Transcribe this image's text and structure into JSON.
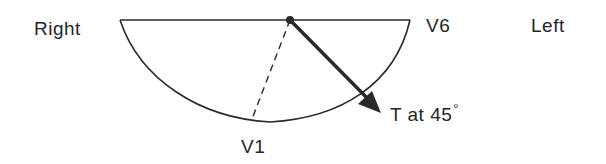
{
  "diagram": {
    "labels": {
      "right": "Right",
      "left": "Left",
      "v6": "V6",
      "v1": "V1",
      "t_vector": "T at 45",
      "degree_symbol": "°"
    },
    "elements": {
      "baseline": "horizontal line from Right side to V6",
      "semicircle": "lower half ellipse below baseline",
      "origin_dot": "filled dot at center of baseline",
      "v1_axis": "dashed line from origin toward V1",
      "t_arrow": "bold arrow from origin at 45 degrees"
    },
    "colors": {
      "stroke": "#2a2a2a",
      "background": "#ffffff"
    },
    "angle_degrees": 45
  }
}
